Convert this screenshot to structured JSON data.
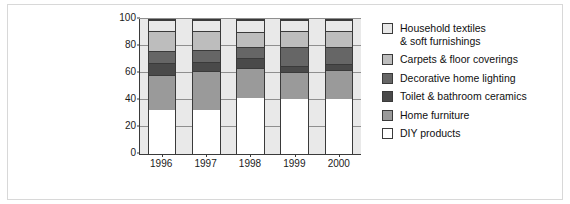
{
  "chart_data": {
    "type": "bar",
    "subtype": "stacked-bar-100-percent",
    "title": "",
    "subtitle": "",
    "xlabel": "",
    "ylabel": "",
    "categories": [
      "1996",
      "1997",
      "1998",
      "1999",
      "2000"
    ],
    "ylim": [
      0,
      100
    ],
    "yticks": [
      0,
      20,
      40,
      60,
      80,
      100
    ],
    "ytick_labels": [
      "0",
      "20",
      "40",
      "60",
      "80",
      "100"
    ],
    "grid": true,
    "legend_position": "right",
    "series": [
      {
        "name": "DIY products",
        "color": "#ffffff",
        "values": [
          33,
          33,
          42,
          41,
          41
        ]
      },
      {
        "name": "Home furniture",
        "color": "#9a9a9a",
        "values": [
          26,
          29,
          22,
          20,
          22
        ]
      },
      {
        "name": "Toilet & bathroom ceramics",
        "color": "#4a4a4a",
        "values": [
          9,
          7,
          8,
          5,
          4
        ]
      },
      {
        "name": "Decorative home lighting",
        "color": "#666666",
        "values": [
          9,
          9,
          8,
          14,
          13
        ]
      },
      {
        "name": "Carpets & floor coverings",
        "color": "#bdbdbd",
        "values": [
          15,
          14,
          11,
          12,
          12
        ]
      },
      {
        "name": "Household textiles & soft furnishings",
        "color": "#e8e8e8",
        "values": [
          8,
          8,
          9,
          8,
          8
        ]
      }
    ],
    "cumulative_tops": {
      "1996": [
        33,
        59,
        68,
        77,
        92,
        100
      ],
      "1997": [
        33,
        62,
        69,
        78,
        92,
        100
      ],
      "1998": [
        42,
        64,
        72,
        80,
        91,
        100
      ],
      "1999": [
        41,
        61,
        66,
        80,
        92,
        100
      ],
      "2000": [
        41,
        63,
        67,
        80,
        92,
        100
      ]
    }
  },
  "legend": {
    "items": [
      {
        "label": "Household textiles\n& soft furnishings",
        "color": "#e8e8e8"
      },
      {
        "label": "Carpets & floor coverings",
        "color": "#bdbdbd"
      },
      {
        "label": "Decorative home lighting",
        "color": "#666666"
      },
      {
        "label": "Toilet & bathroom ceramics",
        "color": "#4a4a4a"
      },
      {
        "label": "Home furniture",
        "color": "#9a9a9a"
      },
      {
        "label": "DIY products",
        "color": "#ffffff"
      }
    ]
  },
  "axis": {
    "ytick_labels": [
      "0",
      "20",
      "40",
      "60",
      "80",
      "100"
    ],
    "xtick_labels": [
      "1996",
      "1997",
      "1998",
      "1999",
      "2000"
    ]
  },
  "colors": {
    "plot_background": "#e9e9e9",
    "axis_line": "#3a3a3a",
    "gridline": "#8f8f8f",
    "frame_border": "#d8d8d8",
    "page_background": "#ffffff"
  }
}
